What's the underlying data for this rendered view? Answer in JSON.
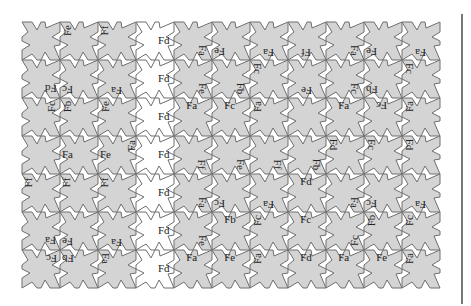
{
  "diagram": {
    "title": "",
    "grid": {
      "cols": 11,
      "rows": 7,
      "origin_x": 22,
      "origin_y": 22,
      "cell": 38
    },
    "colors": {
      "filled": "#d4d4d4",
      "empty": "#ffffff",
      "stroke": "#6e6e6e",
      "divider": "#777777"
    },
    "white_column": 3,
    "white_row_cells": [
      [
        3,
        0
      ],
      [
        3,
        1
      ],
      [
        3,
        2
      ]
    ],
    "labels": [
      {
        "text": "Fe",
        "col": 1,
        "row": 0,
        "pos": "tl",
        "rot": -90
      },
      {
        "text": "Ff",
        "col": 2,
        "row": 0,
        "pos": "tl",
        "rot": -90
      },
      {
        "text": "Fd",
        "col": 3,
        "row": 0,
        "pos": "r",
        "rot": 0
      },
      {
        "text": "Fa",
        "col": 4,
        "row": 0,
        "pos": "br",
        "rot": 90
      },
      {
        "text": "Fe",
        "col": 5,
        "row": 0,
        "pos": "bl",
        "rot": 180
      },
      {
        "text": "Fa",
        "col": 6,
        "row": 0,
        "pos": "b",
        "rot": 180
      },
      {
        "text": "Ff",
        "col": 7,
        "row": 0,
        "pos": "b",
        "rot": 180
      },
      {
        "text": "Fa",
        "col": 8,
        "row": 0,
        "pos": "br",
        "rot": 90
      },
      {
        "text": "Fe",
        "col": 9,
        "row": 0,
        "pos": "bl",
        "rot": 180
      },
      {
        "text": "Fa",
        "col": 10,
        "row": 0,
        "pos": "b",
        "rot": 180
      },
      {
        "text": "Fd",
        "col": 0,
        "row": 1,
        "pos": "br",
        "rot": 180
      },
      {
        "text": "Fc",
        "col": 1,
        "row": 1,
        "pos": "bl",
        "rot": 180
      },
      {
        "text": "Fa",
        "col": 2,
        "row": 1,
        "pos": "b",
        "rot": 180
      },
      {
        "text": "Fd",
        "col": 3,
        "row": 1,
        "pos": "r",
        "rot": 0
      },
      {
        "text": "Fe",
        "col": 4,
        "row": 1,
        "pos": "br",
        "rot": 90
      },
      {
        "text": "Fb",
        "col": 5,
        "row": 1,
        "pos": "br",
        "rot": 90
      },
      {
        "text": "Fc",
        "col": 6,
        "row": 1,
        "pos": "tl",
        "rot": 90
      },
      {
        "text": "Fe",
        "col": 7,
        "row": 1,
        "pos": "b",
        "rot": 180
      },
      {
        "text": "Fc",
        "col": 8,
        "row": 1,
        "pos": "br",
        "rot": 90
      },
      {
        "text": "Fb",
        "col": 9,
        "row": 1,
        "pos": "bl",
        "rot": 180
      },
      {
        "text": "Fc",
        "col": 10,
        "row": 1,
        "pos": "tl",
        "rot": 90
      },
      {
        "text": "Fc",
        "col": 0,
        "row": 2,
        "pos": "tr",
        "rot": -90
      },
      {
        "text": "Fb",
        "col": 1,
        "row": 2,
        "pos": "tl",
        "rot": -90
      },
      {
        "text": "Fe",
        "col": 2,
        "row": 2,
        "pos": "tl",
        "rot": -90
      },
      {
        "text": "Fd",
        "col": 3,
        "row": 2,
        "pos": "r",
        "rot": 0
      },
      {
        "text": "Fa",
        "col": 4,
        "row": 2,
        "pos": "t",
        "rot": 0
      },
      {
        "text": "Fc",
        "col": 5,
        "row": 2,
        "pos": "t",
        "rot": 0
      },
      {
        "text": "Fa",
        "col": 6,
        "row": 2,
        "pos": "tl",
        "rot": -90
      },
      {
        "text": "Fa",
        "col": 8,
        "row": 2,
        "pos": "t",
        "rot": 0
      },
      {
        "text": "Fc",
        "col": 9,
        "row": 2,
        "pos": "t",
        "rot": 180
      },
      {
        "text": "Fa",
        "col": 10,
        "row": 2,
        "pos": "tl",
        "rot": -90
      },
      {
        "text": "Fa",
        "col": 1,
        "row": 3,
        "pos": "l",
        "rot": 0
      },
      {
        "text": "Fe",
        "col": 2,
        "row": 3,
        "pos": "l",
        "rot": 0
      },
      {
        "text": "Fa",
        "col": 2,
        "row": 3,
        "pos": "tl2",
        "rot": -90
      },
      {
        "text": "Fd",
        "col": 3,
        "row": 3,
        "pos": "r",
        "rot": 0
      },
      {
        "text": "Ff",
        "col": 4,
        "row": 3,
        "pos": "br",
        "rot": 90
      },
      {
        "text": "Fe",
        "col": 5,
        "row": 3,
        "pos": "br",
        "rot": 90
      },
      {
        "text": "Ff",
        "col": 6,
        "row": 3,
        "pos": "br",
        "rot": 90
      },
      {
        "text": "Fb",
        "col": 7,
        "row": 3,
        "pos": "br",
        "rot": 90
      },
      {
        "text": "Fd",
        "col": 8,
        "row": 3,
        "pos": "tl",
        "rot": 90
      },
      {
        "text": "Fc",
        "col": 9,
        "row": 3,
        "pos": "tl",
        "rot": 90
      },
      {
        "text": "Fd",
        "col": 10,
        "row": 3,
        "pos": "tl",
        "rot": 90
      },
      {
        "text": "Ff",
        "col": 0,
        "row": 4,
        "pos": "tl",
        "rot": -90
      },
      {
        "text": "Ff",
        "col": 1,
        "row": 4,
        "pos": "tl",
        "rot": -90
      },
      {
        "text": "Ff",
        "col": 2,
        "row": 4,
        "pos": "tl",
        "rot": -90
      },
      {
        "text": "Fd",
        "col": 3,
        "row": 4,
        "pos": "r",
        "rot": 0
      },
      {
        "text": "Fa",
        "col": 4,
        "row": 4,
        "pos": "br",
        "rot": 90
      },
      {
        "text": "Fc",
        "col": 5,
        "row": 4,
        "pos": "bl",
        "rot": 180
      },
      {
        "text": "Fa",
        "col": 6,
        "row": 4,
        "pos": "b",
        "rot": 180
      },
      {
        "text": "Fd",
        "col": 7,
        "row": 4,
        "pos": "t",
        "rot": 0
      },
      {
        "text": "Fa",
        "col": 8,
        "row": 4,
        "pos": "br",
        "rot": 90
      },
      {
        "text": "Fc",
        "col": 9,
        "row": 4,
        "pos": "bl",
        "rot": 180
      },
      {
        "text": "Fa",
        "col": 10,
        "row": 4,
        "pos": "b",
        "rot": 180
      },
      {
        "text": "Fa",
        "col": 0,
        "row": 5,
        "pos": "br",
        "rot": 180
      },
      {
        "text": "Fe",
        "col": 1,
        "row": 5,
        "pos": "bl",
        "rot": 180
      },
      {
        "text": "Fa",
        "col": 2,
        "row": 5,
        "pos": "b",
        "rot": 180
      },
      {
        "text": "Fd",
        "col": 3,
        "row": 5,
        "pos": "r",
        "rot": 0
      },
      {
        "text": "Fe",
        "col": 4,
        "row": 5,
        "pos": "br",
        "rot": 90
      },
      {
        "text": "Fb",
        "col": 5,
        "row": 5,
        "pos": "t",
        "rot": 0
      },
      {
        "text": "Fc",
        "col": 6,
        "row": 5,
        "pos": "tl",
        "rot": -90
      },
      {
        "text": "Fc",
        "col": 7,
        "row": 5,
        "pos": "t",
        "rot": 0
      },
      {
        "text": "Fc",
        "col": 8,
        "row": 5,
        "pos": "br",
        "rot": -90
      },
      {
        "text": "Fb",
        "col": 9,
        "row": 5,
        "pos": "tl",
        "rot": -90
      },
      {
        "text": "Fc",
        "col": 10,
        "row": 5,
        "pos": "tl",
        "rot": -90
      },
      {
        "text": "Fc",
        "col": 0,
        "row": 6,
        "pos": "tr",
        "rot": 180
      },
      {
        "text": "Fb",
        "col": 1,
        "row": 6,
        "pos": "tl",
        "rot": 180
      },
      {
        "text": "Fa",
        "col": 2,
        "row": 6,
        "pos": "tl",
        "rot": 90
      },
      {
        "text": "Fd",
        "col": 3,
        "row": 6,
        "pos": "r",
        "rot": 0
      },
      {
        "text": "Fa",
        "col": 4,
        "row": 6,
        "pos": "t",
        "rot": 0
      },
      {
        "text": "Fe",
        "col": 5,
        "row": 6,
        "pos": "t",
        "rot": 0
      },
      {
        "text": "Fa",
        "col": 6,
        "row": 6,
        "pos": "tl",
        "rot": -90
      },
      {
        "text": "Fd",
        "col": 7,
        "row": 6,
        "pos": "t",
        "rot": 0
      },
      {
        "text": "Fa",
        "col": 8,
        "row": 6,
        "pos": "t",
        "rot": 0
      },
      {
        "text": "Fe",
        "col": 9,
        "row": 6,
        "pos": "t",
        "rot": 0
      },
      {
        "text": "Fa",
        "col": 10,
        "row": 6,
        "pos": "tl",
        "rot": -90
      }
    ]
  }
}
